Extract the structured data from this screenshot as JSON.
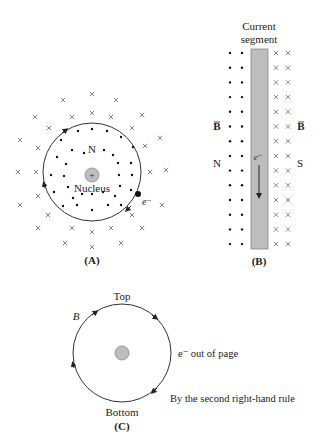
{
  "figure": {
    "panel_a": {
      "caption": "(A)",
      "north_label": "N",
      "nucleus_label": "Nucleus",
      "nucleus_symbol": "+",
      "electron_label": "e⁻",
      "field_inside": "dots (out of page)",
      "field_outside": "crosses (into page)"
    },
    "panel_b": {
      "caption": "(B)",
      "title_line1": "Current",
      "title_line2": "segment",
      "left_pole": "N",
      "right_pole": "S",
      "field_left_label": "B",
      "field_right_label": "B",
      "electron_label": "e⁻"
    },
    "panel_c": {
      "caption": "(C)",
      "top_label": "Top",
      "bottom_label": "Bottom",
      "field_label": "B",
      "electron_note": "e⁻ out of page",
      "rule_note": "By the second right-hand rule"
    },
    "colors": {
      "line": "#333333",
      "segment_fill": "#bdbdbd",
      "nucleus_fill": "#bdbdbd",
      "cross": "#777777"
    }
  }
}
